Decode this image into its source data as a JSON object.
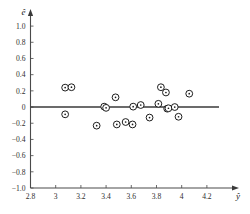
{
  "chart_data": {
    "type": "scatter",
    "title": "",
    "subtitle": "",
    "xlabel": "ŷ",
    "ylabel": "ê",
    "xlim": [
      2.8,
      4.32
    ],
    "ylim": [
      -1.0,
      1.1
    ],
    "grid": false,
    "legend": null,
    "xticks": [
      2.8,
      3.0,
      3.2,
      3.4,
      3.6,
      3.8,
      4.0,
      4.2
    ],
    "xticklabels": [
      "2.8",
      "3",
      "3.2",
      "3.4",
      "3.6",
      "3.8",
      "4",
      "4.2"
    ],
    "yticks": [
      1.0,
      0.8,
      0.6,
      0.4,
      0.2,
      0.0,
      -0.2,
      -0.4,
      -0.6,
      -0.8,
      -1.0
    ],
    "yticklabels": [
      "1.0",
      "0.8",
      "0.6",
      "0.4",
      "0.2",
      "0",
      "-0.2",
      "-0.4",
      "-0.6",
      "-0.8",
      "-1.0"
    ],
    "reference_line": {
      "name": "zero-residual-line",
      "orientation": "horizontal",
      "value": 0.0,
      "color": "#3a3a3a"
    },
    "marker": {
      "style": "open-circle",
      "face_color": "#ffffff",
      "edge_color": "#1d1d1d",
      "size": 3.4
    },
    "points": [
      {
        "x": 3.075,
        "y": 0.24
      },
      {
        "x": 3.125,
        "y": 0.245
      },
      {
        "x": 3.075,
        "y": -0.09
      },
      {
        "x": 3.325,
        "y": -0.23
      },
      {
        "x": 3.385,
        "y": 0.005
      },
      {
        "x": 3.4,
        "y": -0.01
      },
      {
        "x": 3.475,
        "y": 0.12
      },
      {
        "x": 3.485,
        "y": -0.215
      },
      {
        "x": 3.555,
        "y": -0.185
      },
      {
        "x": 3.61,
        "y": -0.215
      },
      {
        "x": 3.615,
        "y": 0.005
      },
      {
        "x": 3.675,
        "y": 0.025
      },
      {
        "x": 3.745,
        "y": -0.13
      },
      {
        "x": 3.815,
        "y": 0.04
      },
      {
        "x": 3.835,
        "y": 0.245
      },
      {
        "x": 3.875,
        "y": 0.18
      },
      {
        "x": 3.885,
        "y": -0.02
      },
      {
        "x": 3.895,
        "y": -0.015
      },
      {
        "x": 3.945,
        "y": 0.0
      },
      {
        "x": 3.975,
        "y": -0.12
      },
      {
        "x": 4.06,
        "y": 0.165
      }
    ],
    "n_points": 21
  },
  "axes": {
    "x_axis_name": "fitted-values-axis",
    "y_axis_name": "residuals-axis",
    "x_arrow": true,
    "y_arrow": true
  }
}
